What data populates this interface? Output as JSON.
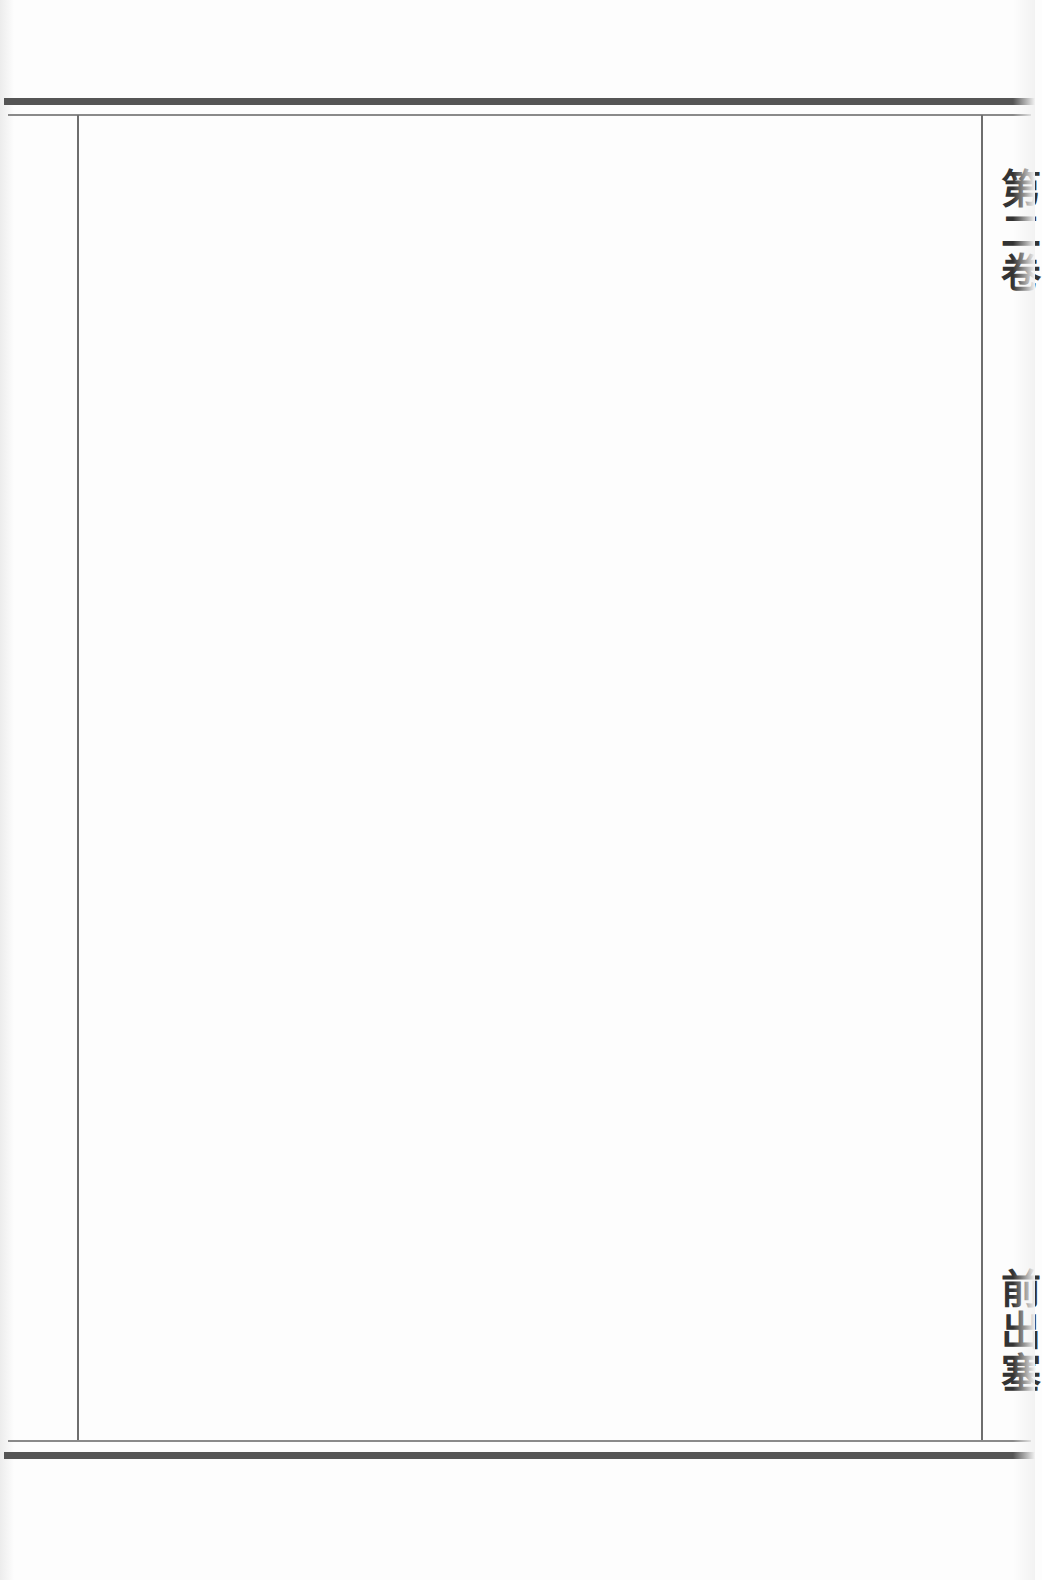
{
  "page": {
    "type": "scanned book page (blank body)",
    "margin_labels": {
      "volume": "第二卷",
      "section_title": "前出塞"
    },
    "colors": {
      "paper": "#fdfdfd",
      "thick_rule": "#555555",
      "thin_rule": "#8a8a8a",
      "frame_line": "#6e6e6e",
      "margin_text": "#333333"
    }
  }
}
